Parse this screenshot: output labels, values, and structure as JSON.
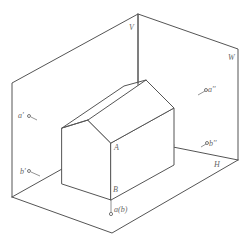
{
  "diagram": {
    "type": "three-view projection planes with house-shaped solid",
    "stroke_color": "#555555",
    "planes": {
      "V": "V",
      "W": "W",
      "H": "H"
    },
    "solid_labels": {
      "A": "A",
      "B": "B"
    },
    "projection_labels": {
      "front": "a(b)",
      "side_a": "a'",
      "side_b": "b'",
      "top_a": "a''",
      "top_b": "b''"
    }
  }
}
